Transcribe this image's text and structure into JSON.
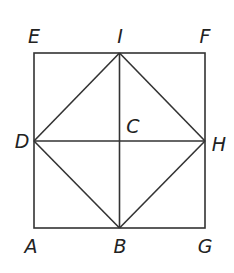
{
  "diagram": {
    "type": "geometry-figure",
    "square": {
      "left": 34,
      "top": 53,
      "right": 205,
      "bottom": 228
    },
    "center": {
      "x": 119.5,
      "y": 141
    },
    "points": [
      {
        "label": "E",
        "x": 34,
        "y": 37
      },
      {
        "label": "I",
        "x": 120,
        "y": 37
      },
      {
        "label": "F",
        "x": 205,
        "y": 37
      },
      {
        "label": "D",
        "x": 22,
        "y": 148
      },
      {
        "label": "C",
        "x": 133,
        "y": 133
      },
      {
        "label": "H",
        "x": 219,
        "y": 151
      },
      {
        "label": "A",
        "x": 31,
        "y": 252
      },
      {
        "label": "B",
        "x": 120,
        "y": 252
      },
      {
        "label": "G",
        "x": 205,
        "y": 252
      }
    ],
    "segments": [
      [
        "E",
        "F"
      ],
      [
        "F",
        "G"
      ],
      [
        "G",
        "A"
      ],
      [
        "A",
        "E"
      ],
      [
        "D",
        "I"
      ],
      [
        "I",
        "H"
      ],
      [
        "H",
        "B"
      ],
      [
        "B",
        "D"
      ],
      [
        "D",
        "H"
      ],
      [
        "I",
        "B"
      ]
    ],
    "stroke_color": "#333333",
    "label_color": "#222222"
  }
}
